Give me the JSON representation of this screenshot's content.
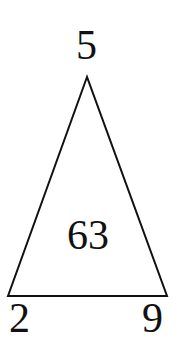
{
  "diagram": {
    "shape": "triangle",
    "vertices": {
      "top": {
        "label": "5",
        "x": 87,
        "y": 77
      },
      "bottom_left": {
        "label": "2",
        "x": 8,
        "y": 296
      },
      "bottom_right": {
        "label": "9",
        "x": 167,
        "y": 296
      }
    },
    "center_value": "63",
    "stroke_color": "#111111",
    "background_color": "#ffffff"
  }
}
